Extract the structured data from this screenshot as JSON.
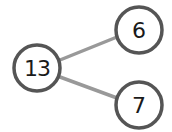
{
  "diagram": {
    "type": "number-bond",
    "whole": {
      "value": "13",
      "cx": 37,
      "cy": 68,
      "r": 23
    },
    "parts": [
      {
        "value": "6",
        "cx": 139,
        "cy": 30,
        "r": 23
      },
      {
        "value": "7",
        "cx": 139,
        "cy": 105,
        "r": 23
      }
    ],
    "colors": {
      "circle_stroke": "#555555",
      "line_stroke": "#999999",
      "text": "#1a1a1a"
    }
  }
}
